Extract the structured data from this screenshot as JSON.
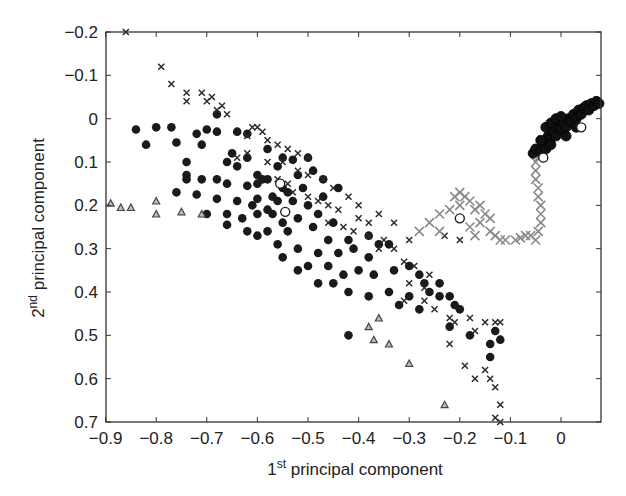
{
  "chart_data": {
    "type": "scatter",
    "title": "",
    "xlabel": "1st principal component",
    "xlabel_parts": {
      "num": "1",
      "sup": "st",
      "rest": " principal component"
    },
    "ylabel": "2nd principal component",
    "ylabel_parts": {
      "num": "2",
      "sup": "nd",
      "rest": " principal component"
    },
    "xlim": [
      -0.9,
      0.08
    ],
    "ylim": [
      -0.2,
      0.7
    ],
    "y_inverted": true,
    "grid": false,
    "legend": null,
    "xticks": [
      -0.9,
      -0.8,
      -0.7,
      -0.6,
      -0.5,
      -0.4,
      -0.3,
      -0.2,
      -0.1,
      0
    ],
    "xtick_labels": [
      "−0.9",
      "−0.8",
      "−0.7",
      "−0.6",
      "−0.5",
      "−0.4",
      "−0.3",
      "−0.2",
      "−0.1",
      "0"
    ],
    "yticks": [
      -0.2,
      -0.1,
      0,
      0.1,
      0.2,
      0.3,
      0.4,
      0.5,
      0.6,
      0.7
    ],
    "ytick_labels": [
      "−0.2",
      "−0.1",
      "0",
      "0.1",
      "0.2",
      "0.3",
      "0.4",
      "0.5",
      "0.6",
      "0.7"
    ],
    "series": [
      {
        "name": "filled circles",
        "marker": "circle",
        "color": "#1a1a1a",
        "points": [
          [
            -0.84,
            0.025
          ],
          [
            -0.82,
            0.06
          ],
          [
            -0.8,
            0.02
          ],
          [
            -0.77,
            0.02
          ],
          [
            -0.76,
            0.055
          ],
          [
            -0.72,
            0.035
          ],
          [
            -0.7,
            0.025
          ],
          [
            -0.71,
            0.06
          ],
          [
            -0.74,
            0.1
          ],
          [
            -0.74,
            0.13
          ],
          [
            -0.68,
            -0.01
          ],
          [
            -0.68,
            0.03
          ],
          [
            -0.64,
            0.03
          ],
          [
            -0.62,
            0.035
          ],
          [
            -0.65,
            0.08
          ],
          [
            -0.62,
            0.09
          ],
          [
            -0.58,
            0.07
          ],
          [
            -0.55,
            0.09
          ],
          [
            -0.53,
            0.095
          ],
          [
            -0.5,
            0.09
          ],
          [
            -0.66,
            0.1
          ],
          [
            -0.64,
            0.11
          ],
          [
            -0.6,
            0.13
          ],
          [
            -0.56,
            0.11
          ],
          [
            -0.52,
            0.13
          ],
          [
            -0.49,
            0.12
          ],
          [
            -0.47,
            0.14
          ],
          [
            -0.44,
            0.16
          ],
          [
            -0.74,
            0.14
          ],
          [
            -0.71,
            0.14
          ],
          [
            -0.68,
            0.14
          ],
          [
            -0.66,
            0.15
          ],
          [
            -0.62,
            0.155
          ],
          [
            -0.6,
            0.15
          ],
          [
            -0.58,
            0.14
          ],
          [
            -0.55,
            0.16
          ],
          [
            -0.51,
            0.16
          ],
          [
            -0.76,
            0.17
          ],
          [
            -0.72,
            0.175
          ],
          [
            -0.68,
            0.185
          ],
          [
            -0.64,
            0.19
          ],
          [
            -0.6,
            0.185
          ],
          [
            -0.57,
            0.18
          ],
          [
            -0.53,
            0.19
          ],
          [
            -0.5,
            0.2
          ],
          [
            -0.47,
            0.18
          ],
          [
            -0.7,
            0.22
          ],
          [
            -0.66,
            0.22
          ],
          [
            -0.63,
            0.23
          ],
          [
            -0.6,
            0.22
          ],
          [
            -0.57,
            0.22
          ],
          [
            -0.55,
            0.24
          ],
          [
            -0.52,
            0.23
          ],
          [
            -0.48,
            0.22
          ],
          [
            -0.45,
            0.24
          ],
          [
            -0.66,
            0.245
          ],
          [
            -0.62,
            0.26
          ],
          [
            -0.58,
            0.26
          ],
          [
            -0.54,
            0.26
          ],
          [
            -0.49,
            0.25
          ],
          [
            -0.46,
            0.28
          ],
          [
            -0.42,
            0.28
          ],
          [
            -0.38,
            0.27
          ],
          [
            -0.36,
            0.29
          ],
          [
            -0.6,
            0.27
          ],
          [
            -0.56,
            0.29
          ],
          [
            -0.52,
            0.3
          ],
          [
            -0.48,
            0.31
          ],
          [
            -0.44,
            0.31
          ],
          [
            -0.41,
            0.3
          ],
          [
            -0.38,
            0.32
          ],
          [
            -0.34,
            0.29
          ],
          [
            -0.55,
            0.32
          ],
          [
            -0.5,
            0.34
          ],
          [
            -0.46,
            0.34
          ],
          [
            -0.43,
            0.36
          ],
          [
            -0.4,
            0.35
          ],
          [
            -0.37,
            0.36
          ],
          [
            -0.33,
            0.35
          ],
          [
            -0.3,
            0.34
          ],
          [
            -0.52,
            0.35
          ],
          [
            -0.48,
            0.38
          ],
          [
            -0.45,
            0.38
          ],
          [
            -0.42,
            0.4
          ],
          [
            -0.38,
            0.41
          ],
          [
            -0.34,
            0.4
          ],
          [
            -0.28,
            0.36
          ],
          [
            -0.27,
            0.38
          ],
          [
            -0.26,
            0.4
          ],
          [
            -0.24,
            0.38
          ],
          [
            -0.24,
            0.41
          ],
          [
            -0.22,
            0.41
          ],
          [
            -0.21,
            0.43
          ],
          [
            -0.3,
            0.41
          ],
          [
            -0.32,
            0.43
          ],
          [
            -0.2,
            0.44
          ],
          [
            -0.42,
            0.5
          ],
          [
            -0.28,
            0.44
          ],
          [
            -0.22,
            0.48
          ],
          [
            -0.18,
            0.5
          ],
          [
            -0.14,
            0.52
          ],
          [
            -0.13,
            0.49
          ],
          [
            -0.12,
            0.51
          ],
          [
            -0.14,
            0.55
          ],
          [
            -0.59,
            0.14
          ],
          [
            -0.58,
            0.21
          ],
          [
            -0.54,
            0.17
          ],
          [
            -0.56,
            0.19
          ],
          [
            -0.61,
            0.2
          ]
        ]
      },
      {
        "name": "dark crosses",
        "marker": "x",
        "color": "#2a2a2a",
        "points": [
          [
            -0.86,
            -0.2
          ],
          [
            -0.79,
            -0.12
          ],
          [
            -0.77,
            -0.08
          ],
          [
            -0.74,
            -0.06
          ],
          [
            -0.74,
            -0.04
          ],
          [
            -0.71,
            -0.06
          ],
          [
            -0.7,
            -0.04
          ],
          [
            -0.69,
            -0.05
          ],
          [
            -0.68,
            -0.02
          ],
          [
            -0.67,
            -0.03
          ],
          [
            -0.66,
            -0.01
          ],
          [
            -0.61,
            0.02
          ],
          [
            -0.6,
            0.02
          ],
          [
            -0.62,
            0.04
          ],
          [
            -0.59,
            0.03
          ],
          [
            -0.58,
            0.05
          ],
          [
            -0.56,
            0.06
          ],
          [
            -0.54,
            0.07
          ],
          [
            -0.52,
            0.08
          ],
          [
            -0.5,
            0.09
          ],
          [
            -0.64,
            0.09
          ],
          [
            -0.62,
            0.08
          ],
          [
            -0.58,
            0.1
          ],
          [
            -0.55,
            0.1
          ],
          [
            -0.52,
            0.12
          ],
          [
            -0.5,
            0.13
          ],
          [
            -0.47,
            0.14
          ],
          [
            -0.45,
            0.16
          ],
          [
            -0.42,
            0.18
          ],
          [
            -0.4,
            0.2
          ],
          [
            -0.56,
            0.14
          ],
          [
            -0.54,
            0.15
          ],
          [
            -0.53,
            0.17
          ],
          [
            -0.5,
            0.18
          ],
          [
            -0.48,
            0.19
          ],
          [
            -0.46,
            0.2
          ],
          [
            -0.44,
            0.21
          ],
          [
            -0.4,
            0.23
          ],
          [
            -0.38,
            0.24
          ],
          [
            -0.36,
            0.22
          ],
          [
            -0.46,
            0.24
          ],
          [
            -0.43,
            0.25
          ],
          [
            -0.41,
            0.26
          ],
          [
            -0.38,
            0.27
          ],
          [
            -0.35,
            0.28
          ],
          [
            -0.33,
            0.3
          ],
          [
            -0.31,
            0.33
          ],
          [
            -0.29,
            0.34
          ],
          [
            -0.26,
            0.36
          ],
          [
            -0.27,
            0.39
          ],
          [
            -0.3,
            0.38
          ],
          [
            -0.31,
            0.42
          ],
          [
            -0.27,
            0.42
          ],
          [
            -0.25,
            0.44
          ],
          [
            -0.22,
            0.46
          ],
          [
            -0.21,
            0.47
          ],
          [
            -0.18,
            0.46
          ],
          [
            -0.17,
            0.49
          ],
          [
            -0.15,
            0.47
          ],
          [
            -0.13,
            0.47
          ],
          [
            -0.12,
            0.47
          ],
          [
            -0.22,
            0.52
          ],
          [
            -0.19,
            0.57
          ],
          [
            -0.17,
            0.6
          ],
          [
            -0.14,
            0.6
          ],
          [
            -0.13,
            0.62
          ],
          [
            -0.12,
            0.66
          ],
          [
            -0.13,
            0.69
          ],
          [
            -0.12,
            0.7
          ],
          [
            -0.15,
            0.58
          ],
          [
            -0.2,
            0.28
          ],
          [
            -0.23,
            0.27
          ],
          [
            -0.3,
            0.28
          ],
          [
            -0.33,
            0.24
          ],
          [
            -0.36,
            0.3
          ]
        ]
      },
      {
        "name": "gray crosses (trajectory)",
        "marker": "x",
        "color": "#8a8a8a",
        "points": [
          [
            -0.26,
            0.24
          ],
          [
            -0.24,
            0.22
          ],
          [
            -0.22,
            0.21
          ],
          [
            -0.21,
            0.18
          ],
          [
            -0.2,
            0.17
          ],
          [
            -0.19,
            0.18
          ],
          [
            -0.18,
            0.19
          ],
          [
            -0.2,
            0.2
          ],
          [
            -0.17,
            0.21
          ],
          [
            -0.16,
            0.2
          ],
          [
            -0.15,
            0.22
          ],
          [
            -0.14,
            0.23
          ],
          [
            -0.16,
            0.24
          ],
          [
            -0.18,
            0.25
          ],
          [
            -0.17,
            0.27
          ],
          [
            -0.14,
            0.26
          ],
          [
            -0.13,
            0.27
          ],
          [
            -0.12,
            0.28
          ],
          [
            -0.11,
            0.28
          ],
          [
            -0.09,
            0.28
          ],
          [
            -0.08,
            0.275
          ],
          [
            -0.07,
            0.27
          ],
          [
            -0.06,
            0.27
          ],
          [
            -0.05,
            0.28
          ],
          [
            -0.045,
            0.26
          ],
          [
            -0.04,
            0.24
          ],
          [
            -0.04,
            0.22
          ],
          [
            -0.04,
            0.2
          ],
          [
            -0.045,
            0.18
          ],
          [
            -0.045,
            0.16
          ],
          [
            -0.05,
            0.14
          ],
          [
            -0.05,
            0.12
          ],
          [
            -0.05,
            0.1
          ],
          [
            -0.045,
            0.09
          ],
          [
            -0.28,
            0.26
          ],
          [
            -0.24,
            0.26
          ]
        ]
      },
      {
        "name": "black dense cluster",
        "marker": "circle-small",
        "color": "#111111",
        "points": [
          [
            -0.055,
            0.08
          ],
          [
            -0.05,
            0.07
          ],
          [
            -0.04,
            0.075
          ],
          [
            -0.035,
            0.06
          ],
          [
            -0.03,
            0.05
          ],
          [
            -0.025,
            0.04
          ],
          [
            -0.02,
            0.045
          ],
          [
            -0.015,
            0.03
          ],
          [
            -0.01,
            0.04
          ],
          [
            -0.005,
            0.02
          ],
          [
            0.0,
            0.025
          ],
          [
            0.005,
            0.01
          ],
          [
            0.01,
            0.02
          ],
          [
            0.015,
            0.0
          ],
          [
            0.02,
            0.005
          ],
          [
            0.025,
            -0.01
          ],
          [
            0.03,
            0.0
          ],
          [
            0.035,
            -0.02
          ],
          [
            0.04,
            -0.01
          ],
          [
            0.045,
            -0.025
          ],
          [
            0.05,
            -0.03
          ],
          [
            0.055,
            -0.02
          ],
          [
            0.06,
            -0.035
          ],
          [
            0.065,
            -0.03
          ],
          [
            0.07,
            -0.04
          ],
          [
            0.075,
            -0.035
          ],
          [
            -0.03,
            0.02
          ],
          [
            -0.02,
            0.01
          ],
          [
            -0.01,
            0.0
          ],
          [
            0.0,
            -0.005
          ],
          [
            -0.04,
            0.05
          ],
          [
            -0.03,
            0.07
          ],
          [
            -0.02,
            0.06
          ],
          [
            0.01,
            0.04
          ],
          [
            0.03,
            0.02
          ]
        ]
      },
      {
        "name": "triangles",
        "marker": "triangle",
        "color": "#444444",
        "points": [
          [
            -0.89,
            0.195
          ],
          [
            -0.87,
            0.205
          ],
          [
            -0.85,
            0.205
          ],
          [
            -0.8,
            0.19
          ],
          [
            -0.8,
            0.22
          ],
          [
            -0.75,
            0.215
          ],
          [
            -0.71,
            0.22
          ],
          [
            -0.38,
            0.48
          ],
          [
            -0.36,
            0.46
          ],
          [
            -0.37,
            0.51
          ],
          [
            -0.34,
            0.52
          ],
          [
            -0.3,
            0.565
          ],
          [
            -0.23,
            0.66
          ]
        ]
      },
      {
        "name": "open circles",
        "marker": "open-circle",
        "color": "#222222",
        "points": [
          [
            -0.555,
            0.15
          ],
          [
            -0.545,
            0.215
          ],
          [
            -0.035,
            0.09
          ],
          [
            0.04,
            0.02
          ],
          [
            -0.2,
            0.23
          ]
        ]
      }
    ]
  }
}
